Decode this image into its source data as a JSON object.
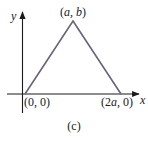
{
  "figure": {
    "caption": "(c)",
    "axes": {
      "x_label": "x",
      "y_label": "y",
      "axis_color": "#1a1a1a"
    },
    "triangle": {
      "stroke_color": "#6b6378",
      "vertices": [
        {
          "name": "origin",
          "label_open": "(",
          "label_a": "0",
          "label_sep": ", ",
          "label_b": "0",
          "label_close": ")",
          "full_label": "(0, 0)"
        },
        {
          "name": "apex",
          "label_open": "(",
          "label_a": "a",
          "label_sep": ", ",
          "label_b": "b",
          "label_close": ")",
          "full_label": "(a, b)"
        },
        {
          "name": "right",
          "label_open": "(",
          "label_a": "2a",
          "label_sep": ", ",
          "label_b": "0",
          "label_close": ")",
          "full_label": "(2a, 0)"
        }
      ]
    }
  }
}
